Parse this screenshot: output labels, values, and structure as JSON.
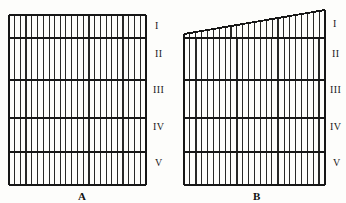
{
  "figure": {
    "background_color": "#fdfdfb",
    "ink_color": "#161616",
    "panels": [
      {
        "id": "A",
        "caption": "A",
        "caption_x": 78,
        "caption_y": 190,
        "shape": "rectangle",
        "left": 9,
        "right": 146,
        "top_left_y": 15,
        "top_right_y": 15,
        "bottom_y": 185,
        "vertical_line_count": 24,
        "row_dividers_y": [
          38,
          80,
          118,
          152
        ],
        "zones": [
          {
            "numeral": "I",
            "label_x": 155,
            "label_y": 20
          },
          {
            "numeral": "II",
            "label_x": 155,
            "label_y": 48
          },
          {
            "numeral": "III",
            "label_x": 153,
            "label_y": 84
          },
          {
            "numeral": "IV",
            "label_x": 153,
            "label_y": 121
          },
          {
            "numeral": "V",
            "label_x": 155,
            "label_y": 157
          }
        ]
      },
      {
        "id": "B",
        "caption": "B",
        "caption_x": 253,
        "caption_y": 190,
        "shape": "right-trapezoid-slanted-top",
        "left": 184,
        "right": 325,
        "top_left_y": 34,
        "top_right_y": 10,
        "bottom_y": 185,
        "vertical_line_count": 24,
        "row_dividers_y": [
          38,
          80,
          118,
          152
        ],
        "zones": [
          {
            "numeral": "I",
            "label_x": 333,
            "label_y": 18
          },
          {
            "numeral": "II",
            "label_x": 332,
            "label_y": 48
          },
          {
            "numeral": "III",
            "label_x": 330,
            "label_y": 84
          },
          {
            "numeral": "IV",
            "label_x": 330,
            "label_y": 121
          },
          {
            "numeral": "V",
            "label_x": 333,
            "label_y": 157
          }
        ]
      }
    ]
  }
}
